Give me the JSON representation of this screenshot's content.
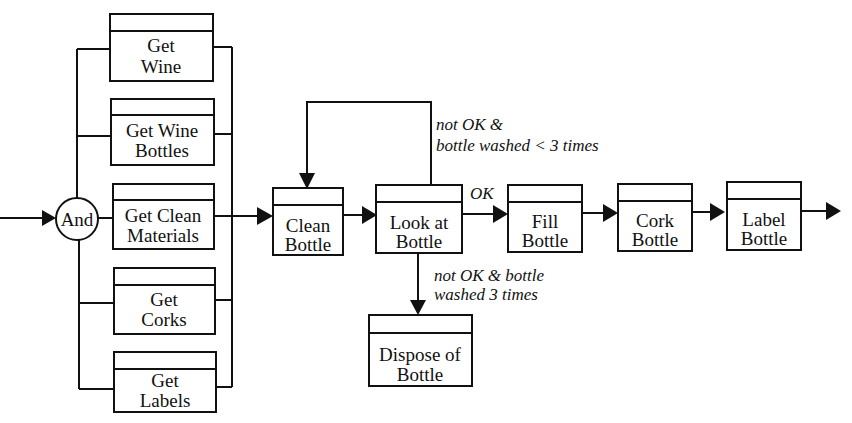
{
  "diagram": {
    "type": "process-flow",
    "start_arrow": "input",
    "junction": {
      "label": "And"
    },
    "parallel_tasks": [
      {
        "id": "get-wine",
        "lines": [
          "Get",
          "Wine"
        ]
      },
      {
        "id": "get-wine-bottles",
        "lines": [
          "Get Wine",
          "Bottles"
        ]
      },
      {
        "id": "get-clean-materials",
        "lines": [
          "Get Clean",
          "Materials"
        ]
      },
      {
        "id": "get-corks",
        "lines": [
          "Get",
          "Corks"
        ]
      },
      {
        "id": "get-labels",
        "lines": [
          "Get",
          "Labels"
        ]
      }
    ],
    "sequence_tasks": [
      {
        "id": "clean-bottle",
        "lines": [
          "Clean",
          "Bottle"
        ]
      },
      {
        "id": "look-at-bottle",
        "lines": [
          "Look at",
          "Bottle"
        ]
      },
      {
        "id": "fill-bottle",
        "lines": [
          "Fill",
          "Bottle"
        ]
      },
      {
        "id": "cork-bottle",
        "lines": [
          "Cork",
          "Bottle"
        ]
      },
      {
        "id": "label-bottle",
        "lines": [
          "Label",
          "Bottle"
        ]
      }
    ],
    "branch_task": {
      "id": "dispose-of-bottle",
      "lines": [
        "Dispose of",
        "Bottle"
      ]
    },
    "conditions": {
      "loop": [
        "not OK &",
        "bottle washed < 3 times"
      ],
      "ok": "OK",
      "dispose": [
        "not OK & bottle",
        "washed 3 times"
      ]
    },
    "edges": [
      {
        "from": "start",
        "to": "And"
      },
      {
        "from": "And",
        "to": "get-wine"
      },
      {
        "from": "And",
        "to": "get-wine-bottles"
      },
      {
        "from": "And",
        "to": "get-clean-materials"
      },
      {
        "from": "And",
        "to": "get-corks"
      },
      {
        "from": "And",
        "to": "get-labels"
      },
      {
        "from": "parallel-join",
        "to": "clean-bottle"
      },
      {
        "from": "clean-bottle",
        "to": "look-at-bottle"
      },
      {
        "from": "look-at-bottle",
        "to": "clean-bottle",
        "label": "not OK & bottle washed < 3 times"
      },
      {
        "from": "look-at-bottle",
        "to": "fill-bottle",
        "label": "OK"
      },
      {
        "from": "look-at-bottle",
        "to": "dispose-of-bottle",
        "label": "not OK & bottle washed 3 times"
      },
      {
        "from": "fill-bottle",
        "to": "cork-bottle"
      },
      {
        "from": "cork-bottle",
        "to": "label-bottle"
      },
      {
        "from": "label-bottle",
        "to": "end"
      }
    ]
  }
}
